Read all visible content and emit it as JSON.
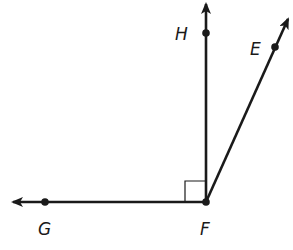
{
  "diagram": {
    "type": "geometry-angles",
    "vertex": {
      "label": "F",
      "x": 206,
      "y": 202
    },
    "points": [
      {
        "label": "H",
        "x": 206,
        "y": 33,
        "label_x": 176,
        "label_y": 39
      },
      {
        "label": "E",
        "x": 275,
        "y": 47,
        "label_x": 250,
        "label_y": 54
      },
      {
        "label": "G",
        "x": 45,
        "y": 202,
        "label_x": 39,
        "label_y": 234
      },
      {
        "label": "F",
        "x": 206,
        "y": 202,
        "label_x": 200,
        "label_y": 234
      }
    ],
    "rays": [
      {
        "name": "ray-FH",
        "from": "F",
        "through": "H",
        "tip": [
          206,
          2
        ]
      },
      {
        "name": "ray-FE",
        "from": "F",
        "through": "E",
        "tip": [
          289,
          17
        ]
      },
      {
        "name": "ray-FG",
        "from": "F",
        "through": "G",
        "tip": [
          11,
          202
        ]
      }
    ],
    "right_angle_marker": {
      "at": "F",
      "between": [
        "G",
        "H"
      ],
      "size": 21
    },
    "stroke_color": "#1a1a1a",
    "labels": {
      "H": "H",
      "E": "E",
      "G": "G",
      "F": "F"
    }
  }
}
